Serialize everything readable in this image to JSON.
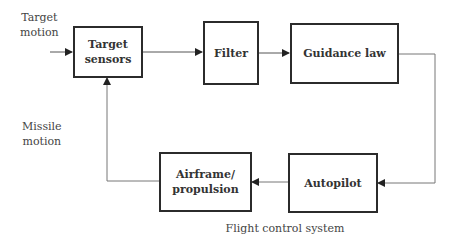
{
  "diagram": {
    "caption": "Flight control system",
    "inputs": {
      "target_motion": {
        "line1": "Target",
        "line2": "motion"
      },
      "missile_motion": {
        "line1": "Missile",
        "line2": "motion"
      }
    },
    "blocks": [
      {
        "id": "target_sensors",
        "line1": "Target",
        "line2": "sensors"
      },
      {
        "id": "filter",
        "line1": "Filter"
      },
      {
        "id": "guidance_law",
        "line1": "Guidance law"
      },
      {
        "id": "autopilot",
        "line1": "Autopilot"
      },
      {
        "id": "airframe_propulsion",
        "line1": "Airframe/",
        "line2": "propulsion"
      }
    ],
    "connections": [
      {
        "from": "target_motion",
        "to": "target_sensors"
      },
      {
        "from": "target_sensors",
        "to": "filter"
      },
      {
        "from": "filter",
        "to": "guidance_law"
      },
      {
        "from": "guidance_law",
        "to": "autopilot"
      },
      {
        "from": "autopilot",
        "to": "airframe_propulsion"
      },
      {
        "from": "airframe_propulsion",
        "to": "target_sensors"
      }
    ]
  }
}
